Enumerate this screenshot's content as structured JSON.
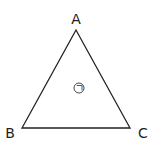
{
  "diagram": {
    "type": "triangle",
    "vertices": [
      {
        "label": "A",
        "x": 76,
        "y": 30
      },
      {
        "label": "B",
        "x": 22,
        "y": 128
      },
      {
        "label": "C",
        "x": 130,
        "y": 128
      }
    ],
    "interior_mark": "ㄱ",
    "stroke_color": "#222222"
  }
}
